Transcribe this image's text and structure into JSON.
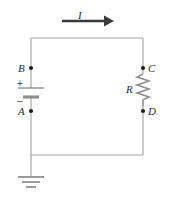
{
  "figure": {
    "background_color": "#ffffff",
    "wire_color": "#a6a6a6",
    "symbol_color": "#8f8f8f",
    "arrow_color": "#3a3a3a",
    "label_color": "#2b2b2b",
    "sign_color": "#4a4a4a"
  },
  "labels": {
    "current": "I",
    "node_b": "B",
    "node_a": "A",
    "node_c": "C",
    "node_d": "D",
    "resistor": "R",
    "terminal_positive": "+",
    "terminal_negative": "–"
  },
  "components": {
    "battery": {
      "name": "battery",
      "orientation": "vertical",
      "positive_terminal": "top",
      "negative_terminal": "bottom",
      "between_nodes": [
        "B",
        "A"
      ]
    },
    "resistor": {
      "name": "resistor",
      "symbol": "zigzag",
      "orientation": "vertical",
      "between_nodes": [
        "C",
        "D"
      ]
    },
    "ground": {
      "name": "ground",
      "symbol": "three-bar-earth",
      "attached_to": "bottom-left-wire"
    },
    "current_arrow": {
      "name": "current-direction-arrow",
      "direction": "right",
      "label": "I"
    }
  },
  "nodes": [
    {
      "id": "B",
      "label": "B",
      "x": 31,
      "y": 68
    },
    {
      "id": "A",
      "label": "A",
      "x": 31,
      "y": 111
    },
    {
      "id": "C",
      "label": "C",
      "x": 143,
      "y": 68
    },
    {
      "id": "D",
      "label": "D",
      "x": 143,
      "y": 111
    }
  ]
}
